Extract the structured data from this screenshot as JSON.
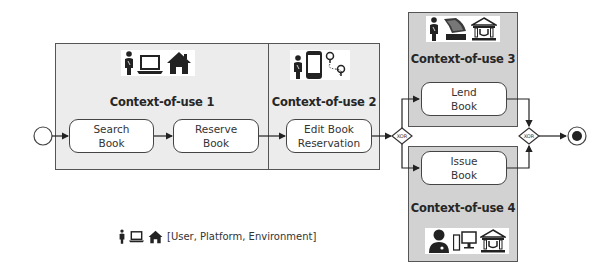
{
  "diagram": {
    "start_node": {
      "label": "start"
    },
    "end_node": {
      "label": "end"
    },
    "contexts": [
      {
        "id": 1,
        "title": "Context-of-use 1",
        "icons": [
          "user-icon",
          "laptop-icon",
          "home-icon"
        ],
        "fill": "#ececec",
        "tasks": [
          {
            "line1": "Search",
            "line2": "Book"
          },
          {
            "line1": "Reserve",
            "line2": "Book"
          }
        ]
      },
      {
        "id": 2,
        "title": "Context-of-use 2",
        "icons": [
          "user-icon",
          "smartphone-icon",
          "location-route-icon"
        ],
        "fill": "#ececec",
        "tasks": [
          {
            "line1": "Edit Book",
            "line2": "Reservation"
          }
        ]
      },
      {
        "id": 3,
        "title": "Context-of-use 3",
        "icons": [
          "user-icon",
          "kiosk-terminal-icon",
          "library-icon"
        ],
        "fill": "#d2d2d2",
        "tasks": [
          {
            "line1": "Lend",
            "line2": "Book"
          }
        ]
      },
      {
        "id": 4,
        "title": "Context-of-use 4",
        "icons": [
          "librarian-icon",
          "desktop-computer-icon",
          "library-icon"
        ],
        "fill": "#d2d2d2",
        "tasks": [
          {
            "line1": "Issue",
            "line2": "Book"
          }
        ]
      }
    ],
    "gateways": [
      {
        "label": "XOR",
        "type": "split"
      },
      {
        "label": "XOR",
        "type": "join"
      }
    ],
    "legend": {
      "icons": [
        "user-icon",
        "laptop-icon",
        "home-icon"
      ],
      "text": "[User, Platform, Environment]"
    }
  }
}
